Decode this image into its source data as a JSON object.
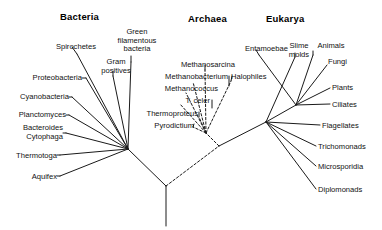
{
  "figure": {
    "background_color": "#ffffff",
    "line_color": "#1a1a1a",
    "width": 382,
    "height": 230
  },
  "domains": [
    {
      "id": "bacteria",
      "label": "Bacteria",
      "x": 60,
      "y": 11,
      "line_style": "solid"
    },
    {
      "id": "archaea",
      "label": "Archaea",
      "x": 188,
      "y": 13,
      "line_style": "dashed"
    },
    {
      "id": "eukarya",
      "label": "Eukarya",
      "x": 266,
      "y": 13,
      "line_style": "solid"
    }
  ],
  "taxa": {
    "bacteria": [
      {
        "id": "spirochetes",
        "lines": [
          "Spirochetes"
        ],
        "x": 38,
        "y": 43,
        "w": 58,
        "align": "right"
      },
      {
        "id": "green-filamentous",
        "lines": [
          "Green",
          "filamentous",
          "bacteria"
        ],
        "x": 113,
        "y": 28,
        "w": 48,
        "align": "center"
      },
      {
        "id": "gram-positives",
        "lines": [
          "Gram",
          "positives"
        ],
        "x": 100,
        "y": 58,
        "w": 32,
        "align": "center"
      },
      {
        "id": "proteobacteria",
        "lines": [
          "Proteobacteria"
        ],
        "x": 20,
        "y": 74,
        "w": 62,
        "align": "right"
      },
      {
        "id": "cyanobacteria",
        "lines": [
          "Cyanobacteria"
        ],
        "x": 8,
        "y": 93,
        "w": 61,
        "align": "right"
      },
      {
        "id": "planctomyces",
        "lines": [
          "Planctomyces"
        ],
        "x": 6,
        "y": 111,
        "w": 60,
        "align": "right"
      },
      {
        "id": "bacteroides-cytophaga",
        "lines": [
          "Bacteroides",
          "Cytophaga"
        ],
        "x": 8,
        "y": 124,
        "w": 55,
        "align": "right"
      },
      {
        "id": "thermotoga",
        "lines": [
          "Thermotoga"
        ],
        "x": 5,
        "y": 152,
        "w": 52,
        "align": "right"
      },
      {
        "id": "aquifex",
        "lines": [
          "Aquifex"
        ],
        "x": 5,
        "y": 173,
        "w": 52,
        "align": "right"
      }
    ],
    "archaea": [
      {
        "id": "methanosarcina",
        "lines": [
          "Methanosarcina"
        ],
        "x": 173,
        "y": 61,
        "w": 62,
        "align": "right"
      },
      {
        "id": "methanobacterium",
        "lines": [
          "Methanobacterium"
        ],
        "x": 152,
        "y": 73,
        "w": 76,
        "align": "right"
      },
      {
        "id": "halophiles",
        "lines": [
          "Halophiles"
        ],
        "x": 231,
        "y": 73,
        "w": 46,
        "align": "left"
      },
      {
        "id": "methanococcus",
        "lines": [
          "Methanococcus"
        ],
        "x": 152,
        "y": 85,
        "w": 66,
        "align": "right"
      },
      {
        "id": "t-celer",
        "lines": [
          "T. celer"
        ],
        "x": 160,
        "y": 97,
        "w": 50,
        "align": "right"
      },
      {
        "id": "thermoproteus",
        "lines": [
          "Thermoproteus"
        ],
        "x": 134,
        "y": 110,
        "w": 64,
        "align": "right"
      },
      {
        "id": "pyrodictium",
        "lines": [
          "Pyrodictium"
        ],
        "x": 136,
        "y": 122,
        "w": 58,
        "align": "right"
      }
    ],
    "eukarya": [
      {
        "id": "entamoebae",
        "lines": [
          "Entamoebae"
        ],
        "x": 238,
        "y": 45,
        "w": 50,
        "align": "right"
      },
      {
        "id": "slime-molds",
        "lines": [
          "Slime",
          "molds"
        ],
        "x": 285,
        "y": 42,
        "w": 28,
        "align": "center"
      },
      {
        "id": "animals",
        "lines": [
          "Animals"
        ],
        "x": 314,
        "y": 42,
        "w": 34,
        "align": "center"
      },
      {
        "id": "fungi",
        "lines": [
          "Fungi"
        ],
        "x": 328,
        "y": 58,
        "w": 30,
        "align": "left"
      },
      {
        "id": "plants",
        "lines": [
          "Plants"
        ],
        "x": 332,
        "y": 84,
        "w": 32,
        "align": "left"
      },
      {
        "id": "ciliates",
        "lines": [
          "Ciliates"
        ],
        "x": 332,
        "y": 101,
        "w": 36,
        "align": "left"
      },
      {
        "id": "flagellates",
        "lines": [
          "Flagellates"
        ],
        "x": 322,
        "y": 122,
        "w": 50,
        "align": "left"
      },
      {
        "id": "trichomonads",
        "lines": [
          "Trichomonads"
        ],
        "x": 318,
        "y": 143,
        "w": 58,
        "align": "left"
      },
      {
        "id": "microsporidia",
        "lines": [
          "Microsporidia"
        ],
        "x": 318,
        "y": 163,
        "w": 58,
        "align": "left"
      },
      {
        "id": "diplomonads",
        "lines": [
          "Diplomonads"
        ],
        "x": 318,
        "y": 186,
        "w": 56,
        "align": "left"
      }
    ]
  },
  "chart_data": {
    "type": "diagram",
    "subtype": "unrooted-phylogenetic-tree",
    "nodes": {
      "root": {
        "x": 166,
        "y": 186
      },
      "root_base": {
        "x": 166,
        "y": 226
      },
      "bacteria_node": {
        "x": 128,
        "y": 149
      },
      "arch_euk_node": {
        "x": 219,
        "y": 146
      },
      "archaea_node": {
        "x": 206,
        "y": 133
      },
      "eukarya_fan": {
        "x": 266,
        "y": 122
      },
      "eukarya_upper": {
        "x": 296,
        "y": 105
      }
    },
    "backbone": [
      {
        "id": "root-stem",
        "from": [
          166,
          186
        ],
        "to": [
          166,
          226
        ],
        "style": "solid"
      },
      {
        "id": "root-bacteria",
        "from": [
          166,
          186
        ],
        "to": [
          128,
          149
        ],
        "style": "solid"
      },
      {
        "id": "root-archeuk",
        "from": [
          166,
          186
        ],
        "to": [
          219,
          146
        ],
        "style": "dashed"
      },
      {
        "id": "archeuk-archaea",
        "from": [
          219,
          146
        ],
        "to": [
          206,
          133
        ],
        "style": "dashed"
      },
      {
        "id": "archeuk-eukarya",
        "from": [
          219,
          146
        ],
        "to": [
          266,
          122
        ],
        "style": "solid"
      },
      {
        "id": "eukfan-upper",
        "from": [
          266,
          122
        ],
        "to": [
          296,
          105
        ],
        "style": "solid"
      }
    ],
    "branches": [
      {
        "taxon": "spirochetes",
        "from": [
          128,
          149
        ],
        "to": [
          77,
          54
        ],
        "style": "solid"
      },
      {
        "taxon": "green-filamentous",
        "from": [
          128,
          149
        ],
        "to": [
          131,
          62
        ],
        "style": "solid"
      },
      {
        "taxon": "gram-positives",
        "from": [
          128,
          149
        ],
        "to": [
          113,
          76
        ],
        "style": "solid"
      },
      {
        "taxon": "proteobacteria",
        "from": [
          128,
          149
        ],
        "to": [
          86,
          78
        ],
        "style": "solid"
      },
      {
        "taxon": "cyanobacteria",
        "from": [
          128,
          149
        ],
        "to": [
          72,
          97
        ],
        "style": "solid"
      },
      {
        "taxon": "planctomyces",
        "from": [
          128,
          149
        ],
        "to": [
          69,
          115
        ],
        "style": "solid"
      },
      {
        "taxon": "bacteroides-cytophaga",
        "from": [
          128,
          149
        ],
        "to": [
          66,
          133
        ],
        "style": "solid"
      },
      {
        "taxon": "thermotoga",
        "from": [
          128,
          149
        ],
        "to": [
          60,
          155
        ],
        "style": "solid"
      },
      {
        "taxon": "aquifex",
        "from": [
          128,
          149
        ],
        "to": [
          60,
          176
        ],
        "style": "solid"
      },
      {
        "taxon": "methanosarcina",
        "from": [
          206,
          133
        ],
        "to": [
          205,
          70
        ],
        "style": "dashed"
      },
      {
        "taxon": "methanobacterium",
        "from": [
          206,
          133
        ],
        "to": [
          193,
          82
        ],
        "style": "dashed"
      },
      {
        "taxon": "halophiles",
        "from": [
          206,
          133
        ],
        "to": [
          231,
          81
        ],
        "style": "dashed"
      },
      {
        "taxon": "methanococcus",
        "from": [
          206,
          133
        ],
        "to": [
          186,
          93
        ],
        "style": "dashed"
      },
      {
        "taxon": "t-celer",
        "from": [
          206,
          133
        ],
        "to": [
          180,
          104
        ],
        "style": "dashed"
      },
      {
        "taxon": "thermoproteus",
        "from": [
          206,
          133
        ],
        "to": [
          199,
          117
        ],
        "style": "dashed"
      },
      {
        "taxon": "pyrodictium",
        "from": [
          206,
          133
        ],
        "to": [
          193,
          127
        ],
        "style": "dashed"
      },
      {
        "taxon": "entamoebae",
        "from": [
          296,
          105
        ],
        "to": [
          259,
          55
        ],
        "style": "solid"
      },
      {
        "taxon": "slime-molds",
        "from": [
          266,
          122
        ],
        "to": [
          295,
          57
        ],
        "style": "solid"
      },
      {
        "taxon": "animals",
        "from": [
          296,
          105
        ],
        "to": [
          313,
          55
        ],
        "style": "solid"
      },
      {
        "taxon": "fungi",
        "from": [
          296,
          105
        ],
        "to": [
          327,
          65
        ],
        "style": "solid"
      },
      {
        "taxon": "plants",
        "from": [
          296,
          105
        ],
        "to": [
          330,
          88
        ],
        "style": "solid"
      },
      {
        "taxon": "ciliates",
        "from": [
          296,
          105
        ],
        "to": [
          330,
          104
        ],
        "style": "solid"
      },
      {
        "taxon": "flagellates",
        "from": [
          266,
          122
        ],
        "to": [
          320,
          125
        ],
        "style": "solid"
      },
      {
        "taxon": "trichomonads",
        "from": [
          266,
          122
        ],
        "to": [
          316,
          146
        ],
        "style": "solid"
      },
      {
        "taxon": "microsporidia",
        "from": [
          266,
          122
        ],
        "to": [
          316,
          166
        ],
        "style": "solid"
      },
      {
        "taxon": "diplomonads",
        "from": [
          266,
          122
        ],
        "to": [
          316,
          189
        ],
        "style": "solid"
      }
    ],
    "leaders": [
      {
        "taxon": "spirochetes",
        "from": [
          72,
          47
        ],
        "to": [
          77,
          54
        ]
      },
      {
        "taxon": "green-filamentous",
        "from": [
          131,
          56
        ],
        "to": [
          131,
          62
        ]
      },
      {
        "taxon": "gram-positives",
        "from": [
          113,
          71
        ],
        "to": [
          113,
          76
        ]
      },
      {
        "taxon": "proteobacteria",
        "from": [
          82,
          78
        ],
        "to": [
          86,
          78
        ]
      },
      {
        "taxon": "cyanobacteria",
        "from": [
          69,
          97
        ],
        "to": [
          72,
          97
        ]
      },
      {
        "taxon": "planctomyces",
        "from": [
          66,
          115
        ],
        "to": [
          69,
          115
        ]
      },
      {
        "taxon": "bacteroides-cytophaga",
        "from": [
          63,
          133
        ],
        "to": [
          66,
          133
        ]
      },
      {
        "taxon": "thermotoga",
        "from": [
          57,
          155
        ],
        "to": [
          60,
          155
        ]
      },
      {
        "taxon": "aquifex",
        "from": [
          57,
          176
        ],
        "to": [
          60,
          176
        ]
      },
      {
        "taxon": "methanosarcina",
        "from": [
          205,
          65
        ],
        "to": [
          205,
          70
        ]
      },
      {
        "taxon": "methanobacterium",
        "from": [
          229,
          76
        ],
        "to": [
          229,
          86
        ]
      },
      {
        "taxon": "halophiles",
        "from": [
          232,
          76
        ],
        "to": [
          231,
          81
        ]
      },
      {
        "taxon": "t-celer",
        "from": [
          212,
          100
        ],
        "to": [
          212,
          108
        ]
      },
      {
        "taxon": "thermoproteus",
        "from": [
          199,
          112
        ],
        "to": [
          199,
          117
        ]
      },
      {
        "taxon": "pyrodictium",
        "from": [
          194,
          124
        ],
        "to": [
          193,
          127
        ]
      },
      {
        "taxon": "entamoebae",
        "from": [
          256,
          50
        ],
        "to": [
          259,
          55
        ]
      },
      {
        "taxon": "slime-molds",
        "from": [
          295,
          53
        ],
        "to": [
          295,
          57
        ]
      },
      {
        "taxon": "animals",
        "from": [
          313,
          51
        ],
        "to": [
          313,
          55
        ]
      }
    ]
  }
}
